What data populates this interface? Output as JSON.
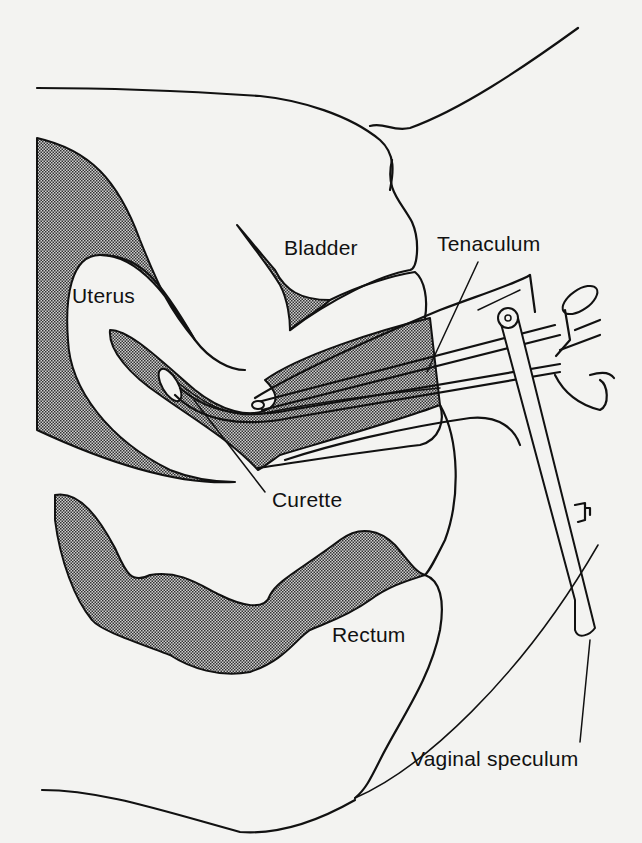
{
  "figure": {
    "type": "anatomical cross-section illustration",
    "labels": {
      "bladder": "Bladder",
      "uterus": "Uterus",
      "tenaculum": "Tenaculum",
      "curette": "Curette",
      "rectum": "Rectum",
      "vaginal_speculum": "Vaginal speculum"
    },
    "colors": {
      "background": "#f3f3f1",
      "ink": "#111111",
      "shading": "#7a7a7a"
    }
  }
}
